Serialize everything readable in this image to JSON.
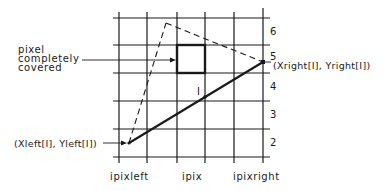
{
  "diagram": {
    "annotations": {
      "pixel_covered_line1": "pixel",
      "pixel_covered_line2": "completely",
      "pixel_covered_line3": "covered",
      "left_point": "(Xleft[I], Yleft[I])",
      "right_point": "(Xright[I], Yright[I])",
      "intersection": "I"
    },
    "x_labels": {
      "left": "ipixleft",
      "mid": "ipix",
      "right": "ipixright"
    },
    "y_labels": [
      "6",
      "5",
      "4",
      "3",
      "2"
    ],
    "colors": {
      "ink": "#1a1a1a",
      "background": "#ffffff"
    }
  }
}
